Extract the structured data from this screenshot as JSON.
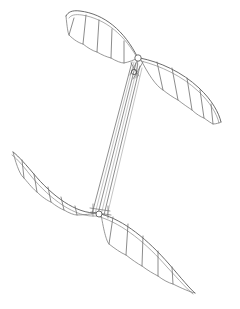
{
  "figure": {
    "style": "technical line drawing",
    "background_color": "#ffffff",
    "line_color": "#5a5a5a",
    "line_color_light": "#9a9a9a",
    "canvas": {
      "width": 240,
      "height": 309
    }
  },
  "chart_data": {
    "type": "line",
    "xlabel": "",
    "ylabel": "",
    "xlim": [
      0,
      240
    ],
    "ylim": [
      0,
      309
    ],
    "grid": false,
    "legend": "none",
    "components": [
      {
        "name": "upper-left-wing",
        "role": "wing-panel",
        "leading_edge": "M 138,58 C 124,30 104,14 80,11 C 72,10 68,12 66,16",
        "leading_edge_inner": "M 139,61 C 125,35 106,19 82,15 C 75,14 71,15 69,18",
        "root": [
          138,
          58
        ],
        "tip": [
          66,
          16
        ],
        "ribs": [
          {
            "x1": 74,
            "y1": 18,
            "x2": 69,
            "y2": 35
          },
          {
            "x1": 86,
            "y1": 15,
            "x2": 83,
            "y2": 44
          },
          {
            "x1": 99,
            "y1": 20,
            "x2": 97,
            "y2": 52
          },
          {
            "x1": 112,
            "y1": 29,
            "x2": 111,
            "y2": 58
          },
          {
            "x1": 124,
            "y1": 41,
            "x2": 124,
            "y2": 63
          }
        ],
        "membrane": "M 66,16 C 67,27 68,33 69,35 C 74,40 79,43 83,44 C 88,48 93,51 97,52 C 102,55 107,57 111,58 C 116,61 121,63 124,63 C 129,62 134,60 138,58"
      },
      {
        "name": "upper-right-wing",
        "role": "wing-panel",
        "leading_edge": "M 140,58 C 160,62 182,72 199,88 C 212,100 219,113 221,122",
        "leading_edge_inner": "M 141,61 C 161,66 182,76 198,91 C 210,102 217,114 219,123",
        "root": [
          140,
          58
        ],
        "tip": [
          221,
          122
        ],
        "ribs": [
          {
            "x1": 157,
            "y1": 62,
            "x2": 163,
            "y2": 90
          },
          {
            "x1": 172,
            "y1": 68,
            "x2": 178,
            "y2": 100
          },
          {
            "x1": 187,
            "y1": 78,
            "x2": 192,
            "y2": 110
          },
          {
            "x1": 200,
            "y1": 90,
            "x2": 204,
            "y2": 118
          },
          {
            "x1": 211,
            "y1": 104,
            "x2": 213,
            "y2": 124
          }
        ],
        "membrane": "M 140,58 C 148,74 156,86 163,90 C 168,94 174,98 178,100 C 183,104 189,108 192,110 C 196,114 201,117 204,118 C 208,121 211,123 213,124 C 216,124 219,123 221,122"
      },
      {
        "name": "lower-left-wing",
        "role": "wing-panel",
        "leading_edge": "M 97,213 C 76,214 52,196 33,173 C 22,160 16,154 13,152",
        "leading_edge_inner": "M 97,216 C 75,218 50,199 31,176 C 21,163 15,157 12,155",
        "root": [
          97,
          213
        ],
        "tip": [
          13,
          152
        ],
        "ribs": [
          {
            "x1": 22,
            "y1": 160,
            "x2": 24,
            "y2": 178
          },
          {
            "x1": 34,
            "y1": 174,
            "x2": 37,
            "y2": 192
          },
          {
            "x1": 48,
            "y1": 187,
            "x2": 51,
            "y2": 202
          },
          {
            "x1": 61,
            "y1": 197,
            "x2": 64,
            "y2": 210
          },
          {
            "x1": 75,
            "y1": 206,
            "x2": 77,
            "y2": 215
          }
        ],
        "membrane": "M 13,152 C 17,168 21,176 24,178 C 29,184 34,190 37,192 C 42,197 48,201 51,202 C 56,206 61,209 64,210 C 69,213 74,215 77,215 C 84,215 91,214 97,213"
      },
      {
        "name": "lower-right-wing",
        "role": "wing-panel",
        "leading_edge": "M 101,214 C 124,220 148,240 169,264 C 182,279 190,289 195,293",
        "leading_edge_inner": "M 100,217 C 123,224 147,244 167,267 C 180,281 188,290 193,294",
        "root": [
          101,
          214
        ],
        "tip": [
          195,
          293
        ],
        "ribs": [
          {
            "x1": 113,
            "y1": 217,
            "x2": 109,
            "y2": 244
          },
          {
            "x1": 128,
            "y1": 224,
            "x2": 126,
            "y2": 255
          },
          {
            "x1": 143,
            "y1": 236,
            "x2": 142,
            "y2": 266
          },
          {
            "x1": 158,
            "y1": 251,
            "x2": 158,
            "y2": 276
          },
          {
            "x1": 172,
            "y1": 267,
            "x2": 173,
            "y2": 284
          }
        ],
        "membrane": "M 101,214 C 104,233 107,242 109,244 C 114,248 121,253 126,255 C 131,259 138,264 142,266 C 147,270 154,274 158,276 C 163,280 169,283 173,284 C 181,288 190,292 195,293"
      },
      {
        "name": "mast-column",
        "role": "structural-column",
        "top": [
          134,
          62
        ],
        "bottom": [
          95,
          214
        ],
        "rod_count": 6,
        "rods": [
          {
            "x1": 132,
            "y1": 62,
            "x2": 92,
            "y2": 214
          },
          {
            "x1": 134,
            "y1": 62,
            "x2": 95,
            "y2": 214
          },
          {
            "x1": 136,
            "y1": 63,
            "x2": 98,
            "y2": 214
          },
          {
            "x1": 138,
            "y1": 64,
            "x2": 101,
            "y2": 215
          },
          {
            "x1": 140,
            "y1": 66,
            "x2": 104,
            "y2": 215
          },
          {
            "x1": 142,
            "y1": 68,
            "x2": 107,
            "y2": 216
          }
        ]
      },
      {
        "name": "upper-hub",
        "role": "pivot-joint",
        "center": [
          138,
          58
        ],
        "radius": 3.2,
        "description": "upper wing pivot hub connecting both upper wing spars to the mast"
      },
      {
        "name": "upper-hub-secondary",
        "role": "pivot-joint",
        "center": [
          134,
          72
        ],
        "radius": 2.6,
        "description": "secondary bearing collar on the mast below the upper hub"
      },
      {
        "name": "lower-hub",
        "role": "pivot-joint",
        "center": [
          99,
          214
        ],
        "radius": 3.0,
        "description": "lower wing pivot hub connecting both lower wing spars to the mast"
      },
      {
        "name": "upper-brace",
        "role": "brace-linkage",
        "segments": [
          {
            "x1": 138,
            "y1": 59,
            "x2": 130,
            "y2": 75
          },
          {
            "x1": 138,
            "y1": 59,
            "x2": 136,
            "y2": 78
          },
          {
            "x1": 131,
            "y1": 63,
            "x2": 139,
            "y2": 76
          },
          {
            "x1": 143,
            "y1": 62,
            "x2": 133,
            "y2": 79
          }
        ]
      },
      {
        "name": "lower-brace",
        "role": "brace-linkage",
        "segments": [
          {
            "x1": 90,
            "y1": 208,
            "x2": 110,
            "y2": 211
          },
          {
            "x1": 91,
            "y1": 212,
            "x2": 111,
            "y2": 215
          },
          {
            "x1": 93,
            "y1": 204,
            "x2": 93,
            "y2": 216
          },
          {
            "x1": 108,
            "y1": 206,
            "x2": 108,
            "y2": 218
          }
        ]
      }
    ]
  }
}
